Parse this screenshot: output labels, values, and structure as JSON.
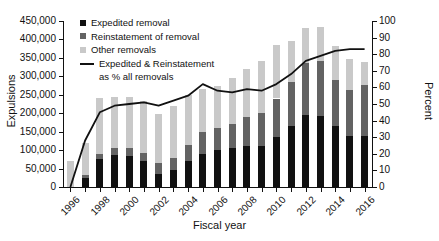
{
  "axes": {
    "y_left_title": "Expulsions",
    "y_right_title": "Percent",
    "x_title": "Fiscal year"
  },
  "legend": {
    "items": [
      {
        "label": "Expedited removal",
        "marker": "square",
        "color": "#111111"
      },
      {
        "label": "Reinstatement of removal",
        "marker": "square",
        "color": "#636363"
      },
      {
        "label": "Other removals",
        "marker": "square",
        "color": "#c9c9c9"
      },
      {
        "label": "Expedited & Reinstatement",
        "label2": "as % all removals",
        "marker": "line",
        "color": "#111111"
      }
    ]
  },
  "chart_data": {
    "type": "bar",
    "title": "",
    "xlabel": "Fiscal year",
    "ylabel": "Expulsions",
    "y2label": "Percent",
    "ylim": [
      0,
      450000
    ],
    "y2lim": [
      0,
      100
    ],
    "ytick_labels": [
      "0",
      "50,000",
      "100,000",
      "150,000",
      "200,000",
      "250,000",
      "300,000",
      "350,000",
      "400,000",
      "450,000"
    ],
    "ytick_values": [
      0,
      50000,
      100000,
      150000,
      200000,
      250000,
      300000,
      350000,
      400000,
      450000
    ],
    "y2tick_labels": [
      "0",
      "10",
      "20",
      "30",
      "40",
      "50",
      "60",
      "70",
      "80",
      "90",
      "100"
    ],
    "y2tick_values": [
      0,
      10,
      20,
      30,
      40,
      50,
      60,
      70,
      80,
      90,
      100
    ],
    "grid": false,
    "legend_position": "upper-left-inside",
    "categories": [
      1996,
      1997,
      1998,
      1999,
      2000,
      2001,
      2002,
      2003,
      2004,
      2005,
      2006,
      2007,
      2008,
      2009,
      2010,
      2011,
      2012,
      2013,
      2014,
      2015,
      2016
    ],
    "xtick_labels": [
      "1996",
      "1998",
      "2000",
      "2002",
      "2004",
      "2006",
      "2008",
      "2010",
      "2012",
      "2014",
      "2016"
    ],
    "stacked": true,
    "series": [
      {
        "name": "Expedited removal",
        "color": "#111111",
        "values": [
          0,
          25000,
          75000,
          88000,
          85000,
          70000,
          35000,
          45000,
          72000,
          90000,
          100000,
          105000,
          110000,
          112000,
          135000,
          165000,
          195000,
          192000,
          165000,
          138000,
          140000
        ]
      },
      {
        "name": "Reinstatement of removal",
        "color": "#636363",
        "values": [
          0,
          8000,
          15000,
          18000,
          20000,
          22000,
          30000,
          35000,
          42000,
          58000,
          60000,
          65000,
          80000,
          88000,
          105000,
          120000,
          140000,
          150000,
          125000,
          125000,
          138000
        ]
      },
      {
        "name": "Other removals",
        "color": "#c9c9c9",
        "values": [
          70000,
          85000,
          150000,
          139000,
          140000,
          142000,
          132000,
          140000,
          136000,
          118000,
          115000,
          125000,
          130000,
          142000,
          145000,
          112000,
          95000,
          93000,
          92000,
          85000,
          62000
        ]
      }
    ],
    "line_series": {
      "name": "Expedited & Reinstatement as % all removals",
      "color": "#111111",
      "unit": "percent",
      "values": [
        0,
        28,
        45,
        49,
        50,
        51,
        49,
        52,
        55,
        62,
        58,
        57,
        59,
        58,
        62,
        68,
        76,
        79,
        82,
        83,
        83
      ]
    }
  }
}
